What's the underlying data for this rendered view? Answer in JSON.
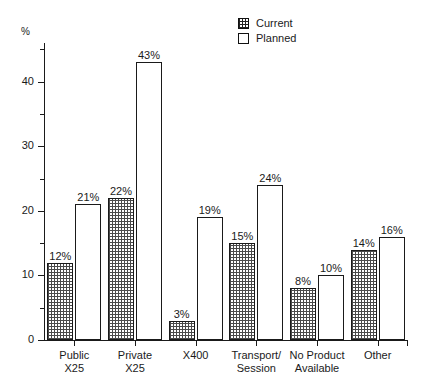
{
  "chart_data": {
    "type": "bar",
    "title": "",
    "subtitle": "",
    "xlabel": "",
    "ylabel": "%",
    "ylim": [
      0,
      46
    ],
    "grid": false,
    "legend_position": "top-right",
    "categories": [
      "Public\nX25",
      "Private\nX25",
      "X400",
      "Transport/\nSession",
      "No Product\nAvailable",
      "Other"
    ],
    "series": [
      {
        "name": "Current",
        "values": [
          12,
          22,
          3,
          15,
          8,
          14
        ],
        "labels": [
          "12%",
          "22%",
          "3%",
          "15%",
          "8%",
          "14%"
        ],
        "fill": "hatched"
      },
      {
        "name": "Planned",
        "values": [
          21,
          43,
          19,
          24,
          10,
          16
        ],
        "labels": [
          "21%",
          "43%",
          "19%",
          "24%",
          "10%",
          "16%"
        ],
        "fill": "empty"
      }
    ],
    "y_ticks_major": [
      {
        "value": 0,
        "label": "0"
      },
      {
        "value": 10,
        "label": "10"
      },
      {
        "value": 20,
        "label": "20"
      },
      {
        "value": 30,
        "label": "30"
      },
      {
        "value": 40,
        "label": "40"
      }
    ],
    "y_ticks_minor": [
      5,
      15,
      25,
      35,
      45
    ],
    "colors": {
      "axis": "#1a1a1a",
      "bar_outline": "#1a1a1a",
      "current_fill": "#4a4a4a",
      "planned_fill": "#ffffff",
      "background": "#ffffff"
    }
  },
  "legend": {
    "items": [
      {
        "label": "Current",
        "swatch": "hatched-square-icon"
      },
      {
        "label": "Planned",
        "swatch": "empty-square-icon"
      }
    ]
  },
  "axis": {
    "unit_label": "%"
  }
}
